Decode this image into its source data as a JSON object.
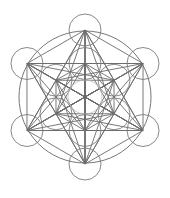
{
  "diagram": {
    "figure_type": "sacred-geometry",
    "node_count": 13,
    "rings": [
      "center",
      "inner-hexagon",
      "outer-hexagon"
    ],
    "colors": {
      "background": "#ffffff",
      "line": "#6b6b6b",
      "center_circle": "#bdbdbd"
    }
  }
}
